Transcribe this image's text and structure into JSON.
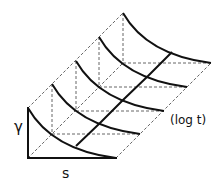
{
  "diagram": {
    "labels": {
      "gamma": "γ",
      "s": "s",
      "log_t": "(log t)"
    },
    "colors": {
      "stroke": "#111111",
      "dashed": "#555555",
      "background": "#ffffff"
    },
    "slices": 5
  }
}
